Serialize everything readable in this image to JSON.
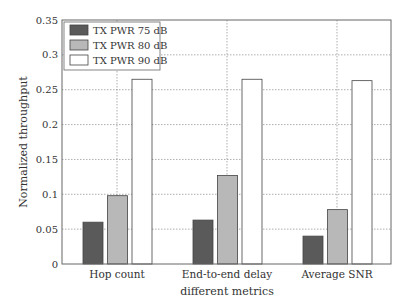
{
  "chart_data": {
    "type": "bar",
    "title": "",
    "xlabel": "different metrics",
    "ylabel": "Normalized throughput",
    "categories": [
      "Hop count",
      "End-to-end delay",
      "Average SNR"
    ],
    "series": [
      {
        "name": "TX PWR 75 dB",
        "color": "#5a5a5a",
        "values": [
          0.06,
          0.063,
          0.04
        ]
      },
      {
        "name": "TX PWR 80 dB",
        "color": "#b8b8b8",
        "values": [
          0.098,
          0.127,
          0.078
        ]
      },
      {
        "name": "TX PWR 90 dB",
        "color": "#ffffff",
        "values": [
          0.265,
          0.265,
          0.263
        ]
      }
    ],
    "ylim": [
      0,
      0.35
    ],
    "yticks": [
      "0",
      "0.05",
      "0.1",
      "0.15",
      "0.2",
      "0.25",
      "0.3",
      "0.35"
    ],
    "grid": true,
    "legend_position": "upper left"
  }
}
